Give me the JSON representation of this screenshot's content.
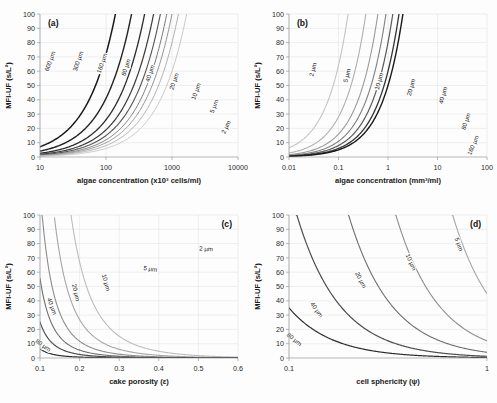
{
  "figure": {
    "background": "#fdfdfd",
    "panel_count": 4
  },
  "chart_data": [
    {
      "id": "a",
      "type": "line",
      "panel_letter": "(a)",
      "title": "",
      "xlabel": "algae concentration (x10³ cells/ml)",
      "ylabel": "MFI-UF (s/L²)",
      "xscale": "log",
      "yscale": "linear",
      "xlim": [
        10,
        10000
      ],
      "ylim": [
        0,
        100
      ],
      "xticks": [
        10,
        100,
        1000,
        10000
      ],
      "xticklabels": [
        "10",
        "100",
        "1000",
        "10000"
      ],
      "yticks": [
        0,
        10,
        20,
        30,
        40,
        50,
        60,
        70,
        80,
        90,
        100
      ],
      "yticklabels": [
        "0",
        "10",
        "20",
        "30",
        "40",
        "50",
        "60",
        "70",
        "80",
        "90",
        "100"
      ],
      "grid": true,
      "legend": "inline-curve-labels",
      "series": [
        {
          "name": "600 µm",
          "color": "#1a1a1a",
          "width": 1.5,
          "x0": 10,
          "y0": 7.2,
          "xref": 82,
          "label_x": 52,
          "label_y": 62
        },
        {
          "name": "300 µm",
          "color": "#232323",
          "width": 1.4,
          "x0": 10,
          "y0": 4.1,
          "xref": 150,
          "label_x": 80,
          "label_y": 62
        },
        {
          "name": "160 µm",
          "color": "#2c2c2c",
          "width": 1.3,
          "x0": 10,
          "y0": 2.6,
          "xref": 255,
          "label_x": 104,
          "label_y": 64
        },
        {
          "name": "80 µm",
          "color": "#3a3a3a",
          "width": 1.2,
          "x0": 10,
          "y0": 1.9,
          "xref": 470,
          "label_x": 128,
          "label_y": 68
        },
        {
          "name": "40 µm",
          "color": "#555555",
          "width": 1.1,
          "x0": 10,
          "y0": 1.5,
          "xref": 950,
          "label_x": 152,
          "label_y": 74
        },
        {
          "name": "20 µm",
          "color": "#787878",
          "width": 1.0,
          "x0": 10,
          "y0": 1.2,
          "xref": 1950,
          "label_x": 176,
          "label_y": 82
        },
        {
          "name": "10 µm",
          "color": "#949494",
          "width": 1.0,
          "x0": 10,
          "y0": 1.0,
          "xref": 3900,
          "label_x": 198,
          "label_y": 92
        },
        {
          "name": "5 µm",
          "color": "#b0b0b0",
          "width": 1.0,
          "x0": 10,
          "y0": 0.8,
          "xref": 7800,
          "label_x": 216,
          "label_y": 107
        },
        {
          "name": "2 µm",
          "color": "#c8c8c8",
          "width": 1.0,
          "x0": 10,
          "y0": 0.6,
          "xref": 19500,
          "label_x": 228,
          "label_y": 128
        }
      ]
    },
    {
      "id": "b",
      "type": "line",
      "panel_letter": "(b)",
      "title": "",
      "xlabel": "algae concentration (mm³/ml)",
      "ylabel": "MFI-UF (s/L²)",
      "xscale": "log",
      "yscale": "linear",
      "xlim": [
        0.01,
        100
      ],
      "ylim": [
        0,
        100
      ],
      "xticks": [
        0.01,
        0.1,
        1,
        10,
        100
      ],
      "xticklabels": [
        "0.01",
        "0.1",
        "1",
        "10",
        "100"
      ],
      "yticks": [
        0,
        10,
        20,
        30,
        40,
        50,
        60,
        70,
        80,
        90,
        100
      ],
      "yticklabels": [
        "0",
        "10",
        "20",
        "30",
        "40",
        "50",
        "60",
        "70",
        "80",
        "90",
        "100"
      ],
      "grid": true,
      "legend": "inline-curve-labels",
      "series": [
        {
          "name": "2 µm",
          "color": "#c4c4c4",
          "width": 1.1,
          "x0": 0.01,
          "y0": 6.4,
          "xref": 0.092,
          "label_x": 66,
          "label_y": 70
        },
        {
          "name": "5 µm",
          "color": "#b0b0b0",
          "width": 1.1,
          "x0": 0.01,
          "y0": 2.8,
          "xref": 0.45,
          "label_x": 100,
          "label_y": 76
        },
        {
          "name": "10 µm",
          "color": "#9a9a9a",
          "width": 1.1,
          "x0": 0.01,
          "y0": 1.6,
          "xref": 1.4,
          "label_x": 132,
          "label_y": 82
        },
        {
          "name": "20 µm",
          "color": "#7e7e7e",
          "width": 1.1,
          "x0": 0.01,
          "y0": 1.1,
          "xref": 4.4,
          "label_x": 164,
          "label_y": 88
        },
        {
          "name": "40 µm",
          "color": "#5a5a5a",
          "width": 1.2,
          "x0": 0.01,
          "y0": 0.8,
          "xref": 15.5,
          "label_x": 196,
          "label_y": 96
        },
        {
          "name": "80 µm",
          "color": "#333333",
          "width": 1.3,
          "x0": 0.01,
          "y0": 0.6,
          "xref": 58,
          "label_x": 219,
          "label_y": 122
        },
        {
          "name": "160 µm",
          "color": "#1a1a1a",
          "width": 1.4,
          "x0": 0.01,
          "y0": 0.5,
          "xref": 230,
          "label_x": 226,
          "label_y": 146
        }
      ]
    },
    {
      "id": "c",
      "type": "line",
      "panel_letter": "(c)",
      "title": "",
      "xlabel": "cake porosity (ε)",
      "ylabel": "MFI-UF (s/L²)",
      "xscale": "linear",
      "yscale": "linear",
      "xlim": [
        0.1,
        0.6
      ],
      "ylim": [
        0,
        100
      ],
      "xticks": [
        0.1,
        0.2,
        0.3,
        0.4,
        0.5,
        0.6
      ],
      "xticklabels": [
        "0.1",
        "0.2",
        "0.3",
        "0.4",
        "0.5",
        "0.6"
      ],
      "yticks": [
        0,
        10,
        20,
        30,
        40,
        50,
        60,
        70,
        80,
        90,
        100
      ],
      "yticklabels": [
        "0",
        "10",
        "20",
        "30",
        "40",
        "50",
        "60",
        "70",
        "80",
        "90",
        "100"
      ],
      "grid": true,
      "legend": "inline-curve-labels",
      "series": [
        {
          "name": "2 µm",
          "color": "#bdbdbd",
          "width": 1.1,
          "scale": 1.0,
          "label_x": 206,
          "label_y": 50
        },
        {
          "name": "5 µm",
          "color": "#a6a6a6",
          "width": 1.1,
          "scale": 0.4,
          "label_x": 150,
          "label_y": 70
        },
        {
          "name": "10 µm",
          "color": "#8d8d8d",
          "width": 1.1,
          "scale": 0.175,
          "label_x": 104,
          "label_y": 82
        },
        {
          "name": "20 µm",
          "color": "#6e6e6e",
          "width": 1.1,
          "scale": 0.082,
          "label_x": 74,
          "label_y": 92
        },
        {
          "name": "40 µm",
          "color": "#4d4d4d",
          "width": 1.2,
          "scale": 0.037,
          "label_x": 50,
          "label_y": 106
        },
        {
          "name": "80 µm",
          "color": "#2e2e2e",
          "width": 1.2,
          "scale": 0.0095,
          "label_x": 42,
          "label_y": 146
        }
      ]
    },
    {
      "id": "d",
      "type": "line",
      "panel_letter": "(d)",
      "title": "",
      "xlabel": "cell sphericity (ψ)",
      "ylabel": "MFI-UF (s/L²)",
      "xscale": "log",
      "yscale": "linear",
      "xlim": [
        0.1,
        1
      ],
      "ylim": [
        0,
        100
      ],
      "xticks": [
        0.1,
        1
      ],
      "xticklabels": [
        "0.1",
        "1"
      ],
      "yticks": [
        0,
        10,
        20,
        30,
        40,
        50,
        60,
        70,
        80,
        90,
        100
      ],
      "yticklabels": [
        "0",
        "10",
        "20",
        "30",
        "40",
        "50",
        "60",
        "70",
        "80",
        "90",
        "100"
      ],
      "grid": true,
      "legend": "inline-curve-labels",
      "series": [
        {
          "name": "5 µm",
          "color": "#a6a6a6",
          "width": 1.1,
          "y_at_1": 45,
          "label_x": 208,
          "label_y": 44
        },
        {
          "name": "10 µm",
          "color": "#8d8d8d",
          "width": 1.1,
          "y_at_1": 12,
          "label_x": 160,
          "label_y": 62
        },
        {
          "name": "20 µm",
          "color": "#6e6e6e",
          "width": 1.1,
          "y_at_1": 4.0,
          "label_x": 110,
          "label_y": 80
        },
        {
          "name": "40 µm",
          "color": "#4d4d4d",
          "width": 1.2,
          "y_at_1": 1.2,
          "label_x": 66,
          "label_y": 110
        },
        {
          "name": "80 µm",
          "color": "#2e2e2e",
          "width": 1.2,
          "y_at_1": 0.35,
          "label_x": 44,
          "label_y": 140
        }
      ]
    }
  ]
}
